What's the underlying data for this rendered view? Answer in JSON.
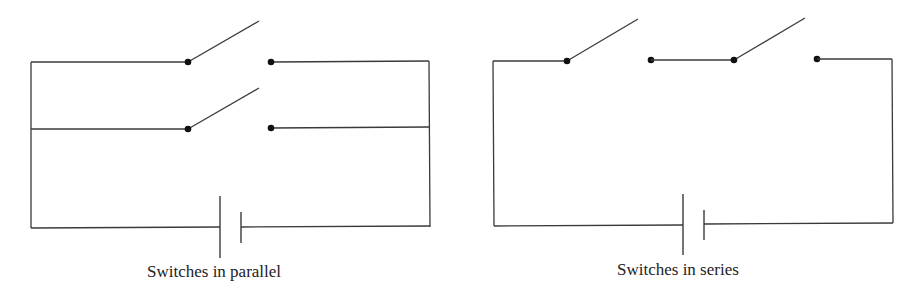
{
  "diagrams": [
    {
      "id": "parallel",
      "caption": "Switches in parallel",
      "switch_count": 2,
      "arrangement": "parallel",
      "battery_count": 1
    },
    {
      "id": "series",
      "caption": "Switches in series",
      "switch_count": 2,
      "arrangement": "series",
      "battery_count": 1
    }
  ],
  "colors": {
    "wire": "#3a3a3a",
    "node": "#111111",
    "background": "#ffffff"
  }
}
